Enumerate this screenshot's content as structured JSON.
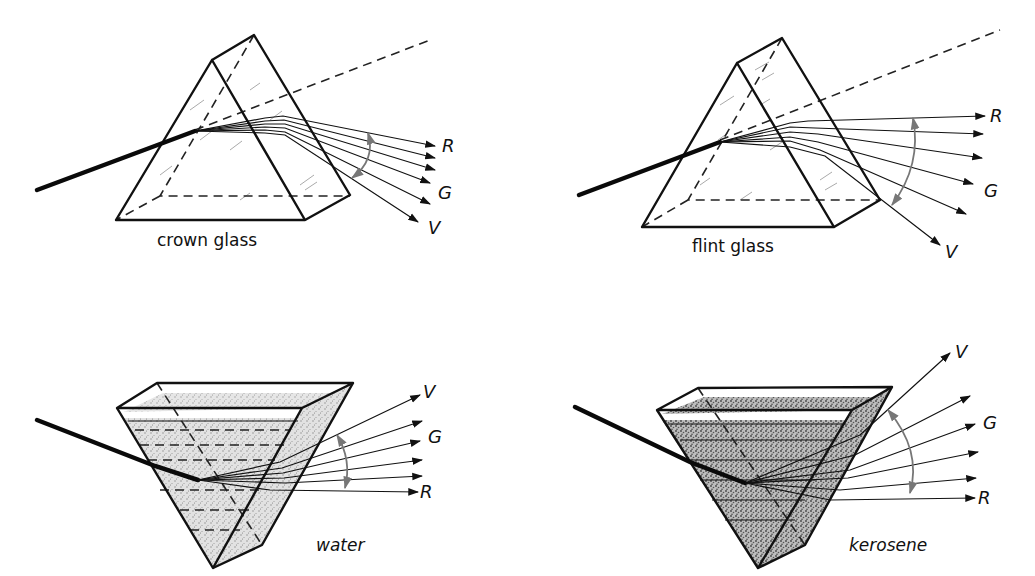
{
  "figure": {
    "panels": [
      {
        "id": "crown",
        "material": "crown glass",
        "ray_labels": [
          "R",
          "G",
          "V"
        ]
      },
      {
        "id": "flint",
        "material": "flint glass",
        "ray_labels": [
          "R",
          "G",
          "V"
        ]
      },
      {
        "id": "water",
        "material": "water",
        "ray_labels": [
          "V",
          "G",
          "R"
        ]
      },
      {
        "id": "kerosene",
        "material": "kerosene",
        "ray_labels": [
          "V",
          "G",
          "R"
        ]
      }
    ]
  },
  "colors": {
    "line": "#111111",
    "arc": "#777777",
    "liquid_fill": "#d9d9d9",
    "liquid_fill_dense": "#b8b8b8",
    "background": "#ffffff"
  }
}
